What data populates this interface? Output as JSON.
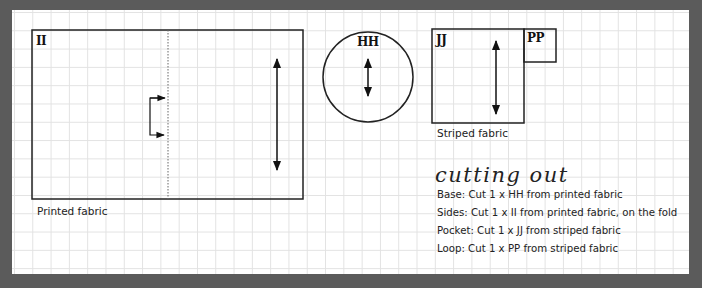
{
  "pieces": {
    "ii": {
      "label": "II",
      "fabric": "Printed fabric"
    },
    "hh": {
      "label": "HH"
    },
    "jj": {
      "label": "JJ",
      "fabric": "Striped fabric"
    },
    "pp": {
      "label": "PP"
    }
  },
  "cutting": {
    "title": "cutting out",
    "lines": [
      "Base: Cut 1 x HH from printed fabric",
      "Sides: Cut 1 x II from printed fabric, on the fold",
      "Pocket: Cut 1 x JJ from striped fabric",
      "Loop: Cut 1 x PP from striped fabric"
    ]
  },
  "colors": {
    "background": "#5b5b5b",
    "paper": "#ffffff",
    "grid": "#e2e2e2",
    "ink": "#222222"
  }
}
